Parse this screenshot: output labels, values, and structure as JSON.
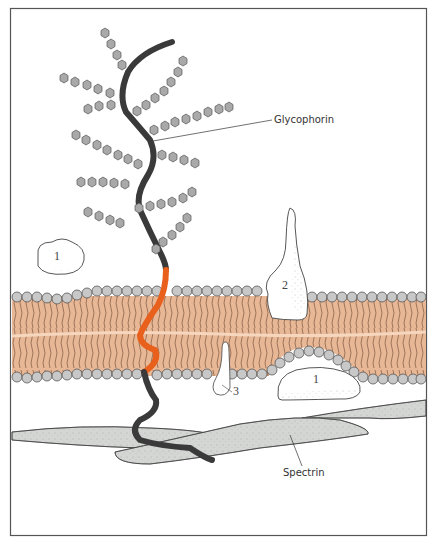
{
  "figure": {
    "type": "cell membrane schematic",
    "colors": {
      "frame": "#555555",
      "bilayer_fill": "#e8b896",
      "bilayer_midline": "#f6d6bd",
      "lipid_tails": "#5a3b2a",
      "head_group": "#c8c8c8",
      "head_group_stroke": "#555555",
      "glycophorin_chain": "#3a3a3a",
      "glycophorin_transmembrane": "#e8601c",
      "sugar_hexagon": "#a9a9a9",
      "spectrin": "#d4d6d4",
      "protein_fill": "#ffffff"
    }
  },
  "labels": {
    "glycophorin": "Glycophorin",
    "spectrin": "Spectrin",
    "protein_1_outer": "1",
    "protein_2": "2",
    "protein_3": "3",
    "protein_1_inner": "1"
  }
}
